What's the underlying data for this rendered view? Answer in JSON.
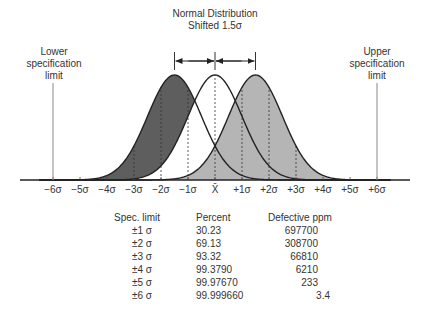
{
  "chart_data": {
    "type": "area",
    "title": "Normal Distribution Shifted 1.5σ",
    "annotations": {
      "lower_spec": "Lower specification limit",
      "upper_spec": "Upper specification limit",
      "shift_arrows": [
        "-1.5σ",
        "+1.5σ"
      ]
    },
    "x_axis": {
      "tick_labels": [
        "−6σ",
        "−5σ",
        "−4σ",
        "−3σ",
        "−2σ",
        "−1σ",
        "X̄",
        "+1σ",
        "+2σ",
        "+3σ",
        "+4σ",
        "+5σ",
        "+6σ"
      ],
      "tick_values": [
        -6,
        -5,
        -4,
        -3,
        -2,
        -1,
        0,
        1,
        2,
        3,
        4,
        5,
        6
      ],
      "range": [
        -7.3,
        7.3
      ]
    },
    "series": [
      {
        "name": "Left shifted distribution",
        "mean": -1.5,
        "sd": 1,
        "fill": "#5e5e5e"
      },
      {
        "name": "Centered distribution",
        "mean": 0,
        "sd": 1,
        "fill": "none"
      },
      {
        "name": "Right shifted distribution",
        "mean": 1.5,
        "sd": 1,
        "fill": "#b3b3b3"
      }
    ],
    "dashed_lines_at": [
      -3,
      -2,
      -1,
      0,
      1,
      2,
      3
    ],
    "spec_limits": [
      -6,
      6
    ],
    "table": {
      "columns": [
        "Spec. limit",
        "Percent",
        "Defective ppm"
      ],
      "rows": [
        [
          "±1 σ",
          "30.23",
          "697700"
        ],
        [
          "±2 σ",
          "69.13",
          "308700"
        ],
        [
          "±3 σ",
          "93.32",
          "66810"
        ],
        [
          "±4 σ",
          "99.3790",
          "6210"
        ],
        [
          "±5 σ",
          "99.97670",
          "233"
        ],
        [
          "±6 σ",
          "99.999660",
          "3.4"
        ]
      ]
    }
  },
  "labels": {
    "title_line1": "Normal Distribution",
    "title_line2": "Shifted 1.5σ",
    "lower_line1": "Lower",
    "lower_line2": "specification",
    "lower_line3": "limit",
    "upper_line1": "Upper",
    "upper_line2": "specification",
    "upper_line3": "limit"
  },
  "colors": {
    "dark_fill": "#5e5e5e",
    "light_fill": "#b5b5b5",
    "curve": "#222222",
    "axis": "#222222",
    "spec_line": "#888888"
  }
}
